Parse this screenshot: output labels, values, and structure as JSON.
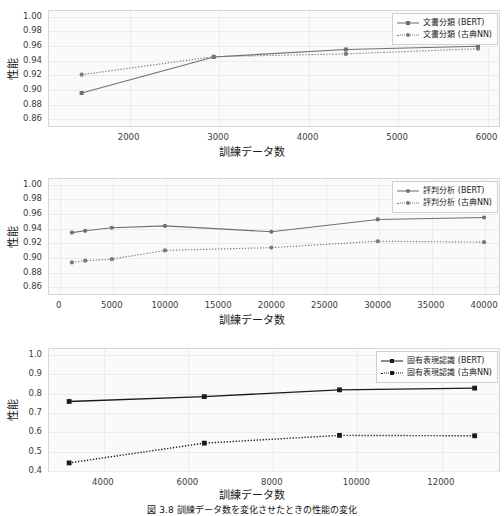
{
  "figure": {
    "caption": "図 3.8  訓練データ数を変化させたときの性能の変化"
  },
  "common": {
    "ylabel": "性能",
    "xlabel": "訓練データ数",
    "bert_color": "#6f6f6f",
    "classic_color": "#7a7a7a",
    "bert_color_dark": "#1a1a1a",
    "classic_color_dark": "#1a1a1a",
    "grid_color": "#ececec",
    "plot_bg": "#fafafa"
  },
  "chart_data": [
    {
      "id": "doc-classification",
      "type": "line",
      "title": "",
      "xlabel": "訓練データ数",
      "ylabel": "性能",
      "xlim": [
        1100,
        6150
      ],
      "ylim": [
        0.848,
        1.008
      ],
      "xticks": [
        2000,
        3000,
        4000,
        5000,
        6000
      ],
      "xtick_labels": [
        "2000",
        "3000",
        "4000",
        "5000",
        "6000"
      ],
      "yticks": [
        0.86,
        0.88,
        0.9,
        0.92,
        0.94,
        0.96,
        0.98,
        1.0
      ],
      "ytick_labels": [
        "0.86",
        "0.88",
        "0.90",
        "0.92",
        "0.94",
        "0.96",
        "0.98",
        "1.00"
      ],
      "grid": true,
      "legend_position": "upper right",
      "series": [
        {
          "name": "文書分類 (BERT)",
          "style": "solid",
          "marker": "square",
          "x": [
            1476,
            2952,
            4428,
            5904
          ],
          "values": [
            0.8945,
            0.9438,
            0.954,
            0.9585
          ]
        },
        {
          "name": "文書分類 (古典NN)",
          "style": "dotted",
          "marker": "circle",
          "x": [
            1476,
            2952,
            4428,
            5904
          ],
          "values": [
            0.9195,
            0.9442,
            0.948,
            0.955
          ]
        }
      ]
    },
    {
      "id": "sentiment-analysis",
      "type": "line",
      "title": "",
      "xlabel": "訓練データ数",
      "ylabel": "性能",
      "xlim": [
        -1000,
        41500
      ],
      "ylim": [
        0.848,
        1.008
      ],
      "xticks": [
        0,
        5000,
        10000,
        15000,
        20000,
        25000,
        30000,
        35000,
        40000
      ],
      "xtick_labels": [
        "0",
        "5000",
        "10000",
        "15000",
        "20000",
        "25000",
        "30000",
        "35000",
        "40000"
      ],
      "yticks": [
        0.86,
        0.88,
        0.9,
        0.92,
        0.94,
        0.96,
        0.98,
        1.0
      ],
      "ytick_labels": [
        "0.86",
        "0.88",
        "0.90",
        "0.92",
        "0.94",
        "0.96",
        "0.98",
        "1.00"
      ],
      "grid": true,
      "legend_position": "upper right",
      "series": [
        {
          "name": "評判分析 (BERT)",
          "style": "solid",
          "marker": "circle",
          "x": [
            1250,
            2500,
            5000,
            10000,
            20000,
            30000,
            40000
          ],
          "values": [
            0.9333,
            0.9358,
            0.94,
            0.9425,
            0.9345,
            0.9513,
            0.954
          ]
        },
        {
          "name": "評判分析 (古典NN)",
          "style": "dotted",
          "marker": "circle",
          "x": [
            1250,
            2500,
            5000,
            10000,
            20000,
            30000,
            40000
          ],
          "values": [
            0.8925,
            0.895,
            0.897,
            0.909,
            0.9128,
            0.9215,
            0.9203
          ]
        }
      ]
    },
    {
      "id": "named-entity-recognition",
      "type": "line",
      "title": "",
      "xlabel": "訓練データ数",
      "ylabel": "性能",
      "xlim": [
        2700,
        13400
      ],
      "ylim": [
        0.39,
        1.03
      ],
      "xticks": [
        4000,
        6000,
        8000,
        10000,
        12000
      ],
      "xtick_labels": [
        "4000",
        "6000",
        "8000",
        "10000",
        "12000"
      ],
      "yticks": [
        0.4,
        0.5,
        0.6,
        0.7,
        0.8,
        0.9,
        1.0
      ],
      "ytick_labels": [
        "0.4",
        "0.5",
        "0.6",
        "0.7",
        "0.8",
        "0.9",
        "1.0"
      ],
      "grid": true,
      "legend_position": "upper right",
      "series": [
        {
          "name": "固有表現認識 (BERT)",
          "style": "solid",
          "marker": "square",
          "x": [
            3200,
            6400,
            9600,
            12800
          ],
          "values": [
            0.754,
            0.779,
            0.814,
            0.823
          ]
        },
        {
          "name": "固有表現認識 (古典NN)",
          "style": "dotted",
          "marker": "square",
          "x": [
            3200,
            6400,
            9600,
            12800
          ],
          "values": [
            0.437,
            0.539,
            0.579,
            0.577
          ]
        }
      ]
    }
  ]
}
